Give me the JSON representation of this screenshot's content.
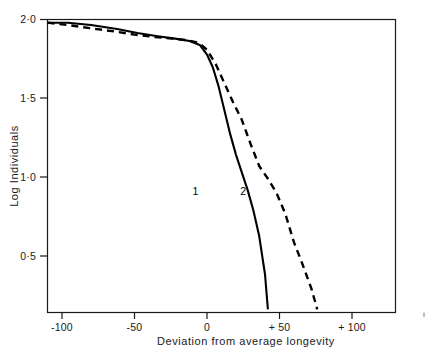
{
  "chart_data": {
    "type": "line",
    "title": "",
    "xlabel": "Deviation from average longevity",
    "ylabel": "Log Individuals",
    "xlim": [
      -110,
      130
    ],
    "ylim": [
      0.18,
      2.02
    ],
    "grid": false,
    "legend": "inline-curve-labels",
    "xticks": [
      -100,
      -50,
      0,
      50,
      100
    ],
    "xtick_labels": [
      "-100",
      "-50",
      "0",
      "+ 50",
      "+ 100"
    ],
    "yticks": [
      0.5,
      1.0,
      1.5,
      2.0
    ],
    "ytick_labels": [
      "0·5",
      "1·0",
      "1·5",
      "2·0"
    ],
    "annotations": [
      {
        "text": "1",
        "x": -8,
        "y": 0.92,
        "series": "1"
      },
      {
        "text": "2",
        "x": 25,
        "y": 0.92,
        "series": "2"
      }
    ],
    "series": [
      {
        "name": "1",
        "label": "1",
        "style": "solid",
        "color": "#000000",
        "x": [
          -110,
          -96,
          -80,
          -62,
          -48,
          -34,
          -22,
          -12,
          -5,
          0,
          4,
          8,
          12,
          16,
          20,
          24,
          28,
          32,
          36,
          40,
          42
        ],
        "y": [
          2.0,
          2.0,
          1.985,
          1.96,
          1.935,
          1.915,
          1.9,
          1.885,
          1.86,
          1.8,
          1.72,
          1.6,
          1.45,
          1.3,
          1.17,
          1.06,
          0.95,
          0.82,
          0.66,
          0.42,
          0.2
        ]
      },
      {
        "name": "2",
        "label": "2",
        "style": "dashed",
        "color": "#000000",
        "x": [
          -110,
          -96,
          -80,
          -64,
          -50,
          -36,
          -24,
          -14,
          -6,
          0,
          6,
          12,
          18,
          24,
          30,
          36,
          42,
          48,
          54,
          60,
          66,
          72,
          76
        ],
        "y": [
          2.0,
          1.985,
          1.965,
          1.945,
          1.925,
          1.91,
          1.9,
          1.89,
          1.875,
          1.83,
          1.74,
          1.62,
          1.5,
          1.39,
          1.24,
          1.1,
          1.02,
          0.93,
          0.8,
          0.62,
          0.48,
          0.33,
          0.2
        ]
      }
    ]
  },
  "figure": {
    "caption_cut_off": ""
  }
}
